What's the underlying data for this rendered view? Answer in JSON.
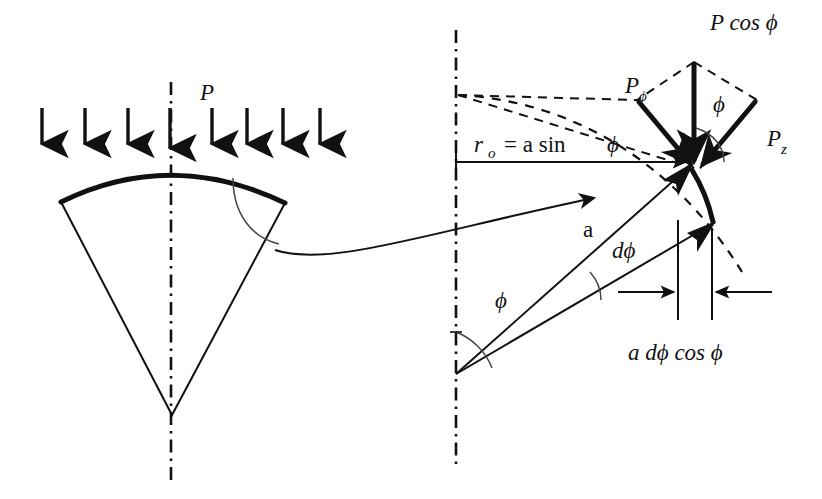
{
  "figure": {
    "background_color": "#ffffff",
    "ink_color": "#111111",
    "width": 822,
    "height": 499
  },
  "left_panel": {
    "name": "loaded-spherical-cap",
    "load_label": "P",
    "load_arrow_count": 8,
    "load_arrow_x": [
      42,
      85,
      128,
      170,
      212,
      247,
      283,
      320
    ],
    "load_arrow_top_y": 108,
    "load_arrow_bottom_y": 148,
    "cap": {
      "left_corner": [
        61,
        202
      ],
      "crown": [
        171,
        163
      ],
      "right_corner": [
        285,
        203
      ],
      "apex": [
        172,
        415
      ]
    },
    "centerline": {
      "x": 171,
      "top_y": 82,
      "bottom_y": 480
    }
  },
  "right_panel": {
    "name": "shell-element-force-resolution",
    "centerline": {
      "x": 456,
      "top_y": 30,
      "bottom_y": 470
    },
    "origin": [
      456,
      374
    ],
    "labels": {
      "radius_dimension": "r",
      "radius_dimension_sub": "o",
      "radius_dimension_rest": "= a sin",
      "radius_dimension_phi": "ϕ",
      "radius_a": "a",
      "d_phi": "dϕ",
      "phi": "ϕ",
      "p_cos_phi": "P cos ϕ",
      "p_phi_main": "P",
      "p_phi_sub": "ϕ",
      "p_z_main": "P",
      "p_z_sub": "z",
      "arc_width": "a dϕ cos ϕ"
    },
    "dimension_line": {
      "name": "r0-dimension",
      "from": [
        456,
        162
      ],
      "to": [
        690,
        162
      ]
    },
    "element_width_markers": {
      "name": "a-dphi-cos-phi-dimension",
      "left_extension_x": 678,
      "right_extension_x": 712,
      "arrow_y": 292,
      "extension_top_y": 220,
      "extension_bottom_y": 320
    },
    "vectors": [
      {
        "name": "P-cos-phi-vector",
        "label": "P cos ϕ",
        "from": [
          694,
          62
        ],
        "to": [
          697,
          172
        ]
      },
      {
        "name": "P-phi-vector",
        "label": "Pϕ",
        "from": [
          637,
          100
        ],
        "to": [
          697,
          172
        ]
      },
      {
        "name": "P-z-vector",
        "label": "Pz",
        "from": [
          757,
          100
        ],
        "to": [
          697,
          172
        ]
      }
    ]
  },
  "connector": {
    "name": "detail-leader-arrow",
    "from": [
      275,
      250
    ],
    "to": [
      598,
      197
    ]
  }
}
